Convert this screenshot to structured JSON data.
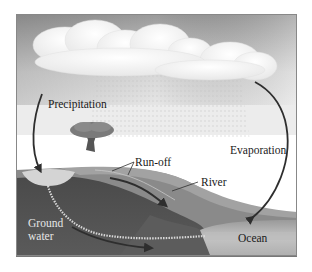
{
  "diagram": {
    "type": "water-cycle",
    "colors": {
      "sky_top": "#9a9a9a",
      "sky_bottom": "#e4e4e4",
      "cloud": "#fbfbfb",
      "land_surface": "#8c8c8c",
      "soil": "#3a3a3a",
      "ocean": "#a8a8a8",
      "arrow": "#2e2e2e",
      "groundwater_flow": "#d8d8d8"
    },
    "labels": {
      "precipitation": "Precipitation",
      "evaporation": "Evaporation",
      "run_off": "Run-off",
      "river": "River",
      "ground_water_line1": "Ground",
      "ground_water_line2": "water",
      "ocean": "Ocean"
    }
  }
}
